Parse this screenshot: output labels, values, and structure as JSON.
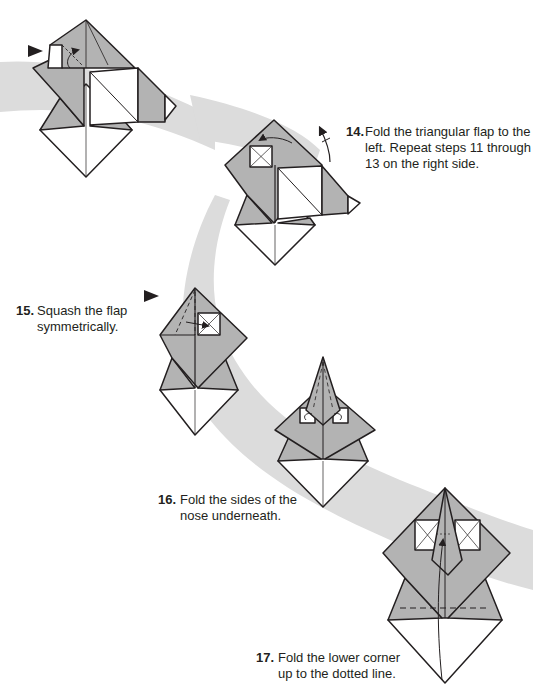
{
  "page": {
    "background": "#ffffff",
    "band_color": "#d9d9d9",
    "paper_gray": "#b3b3b3",
    "paper_white": "#ffffff",
    "line_color": "#231f20"
  },
  "steps": [
    {
      "number": "14.",
      "text_line1": "Fold the triangular flap to the",
      "text_line2": "left. Repeat steps 11 through",
      "text_line3": "13 on the right side.",
      "diagram": "triangular-flap-fold-left"
    },
    {
      "number": "15.",
      "text_line1": "Squash the flap",
      "text_line2": "symmetrically.",
      "diagram": "squash-flap"
    },
    {
      "number": "16.",
      "text_line1": "Fold the sides of the",
      "text_line2": "nose underneath.",
      "diagram": "fold-nose-sides-under"
    },
    {
      "number": "17.",
      "text_line1": "Fold the lower corner",
      "text_line2": "up to the dotted line.",
      "diagram": "fold-lower-corner-up"
    }
  ],
  "previous_diagram": "step-13-result",
  "icons": {
    "push_arrow": "filled-triangle-arrow",
    "fold_arrow": "curved-arrow",
    "repeat_arrow": "curved-arrow-with-tick"
  }
}
